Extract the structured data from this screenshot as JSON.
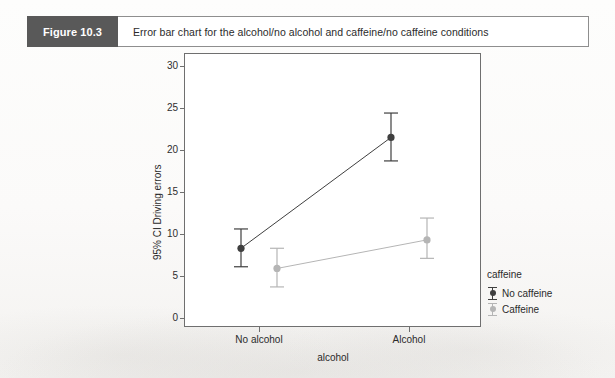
{
  "figure": {
    "tag": "Figure 10.3",
    "caption": "Error bar chart for the alcohol/no alcohol and caffeine/no caffeine conditions"
  },
  "legend": {
    "title": "caffeine",
    "entries": [
      {
        "label": "No caffeine",
        "color": "#3f3f3f"
      },
      {
        "label": "Caffeine",
        "color": "#b5b5b5"
      }
    ]
  },
  "chart_data": {
    "type": "line",
    "title": "Error bar chart for the alcohol/no alcohol and caffeine/no caffeine conditions",
    "xlabel": "alcohol",
    "ylabel": "95% CI Driving errors",
    "categories": [
      "No alcohol",
      "Alcohol"
    ],
    "ylim": [
      0,
      30
    ],
    "yticks": [
      0,
      5,
      10,
      15,
      20,
      25,
      30
    ],
    "ytick_labels": [
      "0",
      "5",
      "10",
      "15",
      "20",
      "25",
      "30"
    ],
    "grid": false,
    "legend_position": "right",
    "error_bars": "95% CI",
    "series": [
      {
        "name": "No caffeine",
        "color": "#3f3f3f",
        "values": [
          8.3,
          21.5
        ],
        "ci_lower": [
          6.1,
          18.7
        ],
        "ci_upper": [
          10.6,
          24.4
        ],
        "x_offsets": [
          -0.12,
          -0.12
        ]
      },
      {
        "name": "Caffeine",
        "color": "#b5b5b5",
        "values": [
          5.9,
          9.3
        ],
        "ci_lower": [
          3.7,
          7.1
        ],
        "ci_upper": [
          8.3,
          11.9
        ],
        "x_offsets": [
          0.12,
          0.12
        ]
      }
    ]
  }
}
